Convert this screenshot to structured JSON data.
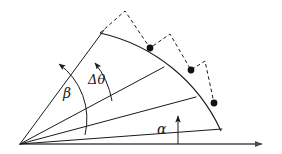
{
  "figure": {
    "background_color": "#ffffff",
    "stroke_color": "#1a1a1a",
    "axis_color": "#4a4a4a",
    "labels": {
      "beta": "β",
      "delta_theta": "Δθ",
      "alpha": "α"
    },
    "geometry": {
      "origin": [
        20,
        144
      ],
      "axis_end": [
        270,
        144
      ],
      "rays": [
        {
          "name": "ray-alpha",
          "from": [
            20,
            144
          ],
          "to": [
            222,
            129
          ]
        },
        {
          "name": "ray-second",
          "from": [
            20,
            144
          ],
          "to": [
            196,
            97
          ]
        },
        {
          "name": "ray-third",
          "from": [
            20,
            144
          ],
          "to": [
            164,
            67
          ]
        },
        {
          "name": "ray-beta",
          "from": [
            20,
            144
          ],
          "to": [
            104,
            30
          ]
        }
      ],
      "main_arc": {
        "start": [
          100,
          33
        ],
        "end": [
          221,
          131
        ],
        "radius": 175
      },
      "angle_arc_beta": {
        "start": [
          83,
          132
        ],
        "end": [
          59,
          62
        ]
      },
      "angle_arc_dtheta": {
        "start": [
          107,
          104
        ],
        "end": [
          93,
          61
        ]
      },
      "dots": [
        [
          150,
          48
        ],
        [
          191,
          70
        ],
        [
          214,
          103
        ]
      ],
      "dashed_path": [
        [
          100,
          33
        ],
        [
          125,
          11
        ],
        [
          150,
          48
        ],
        [
          170,
          34
        ],
        [
          191,
          70
        ],
        [
          205,
          61
        ],
        [
          214,
          103
        ]
      ],
      "alpha_arrow": {
        "from": [
          178,
          144
        ],
        "to": [
          178,
          113
        ]
      }
    }
  }
}
